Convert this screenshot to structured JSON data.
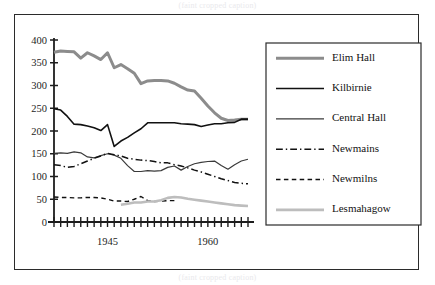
{
  "figure": {
    "caption_top": "(faint cropped caption)",
    "caption_bottom": "(faint cropped caption)"
  },
  "chart_data": {
    "type": "line",
    "title": "",
    "xlabel": "",
    "ylabel": "",
    "xlim": [
      1937,
      1966
    ],
    "ylim": [
      0,
      400
    ],
    "yticks": [
      0,
      50,
      100,
      150,
      200,
      250,
      300,
      350,
      400
    ],
    "ytick_labels": [
      "0",
      "50",
      "100",
      "150",
      "200",
      "250",
      "300",
      "350",
      "400"
    ],
    "xticks_labeled": [
      1945,
      1960
    ],
    "xtick_labels": [
      "1945",
      "1960"
    ],
    "xtick_count": 30,
    "grid": false,
    "legend_position": "right",
    "series": [
      {
        "name": "Elim Hall",
        "color": "#8c8c8c",
        "style": "solid",
        "width": 3,
        "x": [
          1937,
          1938,
          1939,
          1940,
          1941,
          1942,
          1943,
          1944,
          1945,
          1946,
          1947,
          1948,
          1949,
          1950,
          1951,
          1952,
          1953,
          1954,
          1955,
          1956,
          1957,
          1958,
          1959,
          1960,
          1961,
          1962,
          1963,
          1964,
          1965,
          1966
        ],
        "values": [
          373,
          376,
          375,
          374,
          360,
          372,
          365,
          357,
          372,
          339,
          346,
          337,
          327,
          304,
          310,
          311,
          311,
          310,
          305,
          297,
          290,
          288,
          272,
          255,
          240,
          228,
          223,
          224,
          226,
          226
        ]
      },
      {
        "name": "Kilbirnie",
        "color": "#111111",
        "style": "solid",
        "width": 1.6,
        "x": [
          1937,
          1938,
          1939,
          1940,
          1941,
          1942,
          1943,
          1944,
          1945,
          1946,
          1947,
          1948,
          1949,
          1950,
          1951,
          1952,
          1953,
          1954,
          1955,
          1956,
          1957,
          1958,
          1959,
          1960,
          1961,
          1962,
          1963,
          1964,
          1965,
          1966
        ],
        "values": [
          249,
          246,
          232,
          215,
          214,
          211,
          207,
          201,
          214,
          166,
          178,
          186,
          196,
          205,
          218,
          218,
          218,
          218,
          218,
          216,
          215,
          214,
          210,
          213,
          216,
          216,
          218,
          219,
          226,
          226
        ]
      },
      {
        "name": "Central Hall",
        "color": "#3a3a3a",
        "style": "solid",
        "width": 1.2,
        "x": [
          1937,
          1938,
          1939,
          1940,
          1941,
          1942,
          1943,
          1944,
          1945,
          1946,
          1947,
          1948,
          1949,
          1950,
          1951,
          1952,
          1953,
          1954,
          1955,
          1956,
          1957,
          1958,
          1959,
          1960,
          1961,
          1962,
          1963,
          1964,
          1965,
          1966
        ],
        "values": [
          151,
          152,
          151,
          154,
          152,
          143,
          141,
          146,
          150,
          147,
          140,
          124,
          111,
          111,
          113,
          112,
          113,
          120,
          123,
          114,
          122,
          128,
          131,
          133,
          134,
          124,
          116,
          126,
          134,
          138
        ]
      },
      {
        "name": "Newmains",
        "color": "#111111",
        "style": "dashdot",
        "width": 1.5,
        "x": [
          1937,
          1938,
          1939,
          1940,
          1941,
          1942,
          1943,
          1944,
          1945,
          1946,
          1947,
          1948,
          1949,
          1950,
          1951,
          1952,
          1953,
          1954,
          1955,
          1956,
          1957,
          1958,
          1959,
          1960,
          1961,
          1962,
          1963,
          1964,
          1965,
          1966
        ],
        "values": [
          126,
          124,
          120,
          122,
          128,
          134,
          140,
          145,
          151,
          148,
          145,
          140,
          138,
          136,
          135,
          133,
          130,
          130,
          126,
          123,
          119,
          114,
          110,
          105,
          100,
          95,
          91,
          87,
          85,
          84
        ]
      },
      {
        "name": "Newmilns",
        "color": "#111111",
        "style": "dashed",
        "width": 1.4,
        "x": [
          1937,
          1938,
          1939,
          1940,
          1941,
          1942,
          1943,
          1944,
          1945,
          1946,
          1947,
          1948,
          1949,
          1950,
          1951,
          1952,
          1953,
          1954,
          1955
        ],
        "values": [
          55,
          54,
          54,
          53,
          53,
          54,
          54,
          53,
          50,
          46,
          46,
          45,
          50,
          56,
          47,
          45,
          46,
          47,
          47
        ]
      },
      {
        "name": "Lesmahagow",
        "color": "#bdbdbd",
        "style": "solid",
        "width": 2.6,
        "x": [
          1947,
          1948,
          1949,
          1950,
          1951,
          1952,
          1953,
          1954,
          1955,
          1956,
          1957,
          1958,
          1959,
          1960,
          1961,
          1962,
          1963,
          1964,
          1965,
          1966
        ],
        "values": [
          38,
          40,
          43,
          43,
          45,
          45,
          48,
          53,
          55,
          54,
          51,
          49,
          47,
          45,
          43,
          41,
          39,
          37,
          36,
          35
        ]
      }
    ]
  },
  "legend": {
    "items": [
      {
        "label": "Elim Hall"
      },
      {
        "label": "Kilbirnie"
      },
      {
        "label": "Central Hall"
      },
      {
        "label": "Newmains"
      },
      {
        "label": "Newmilns"
      },
      {
        "label": "Lesmahagow"
      }
    ]
  }
}
